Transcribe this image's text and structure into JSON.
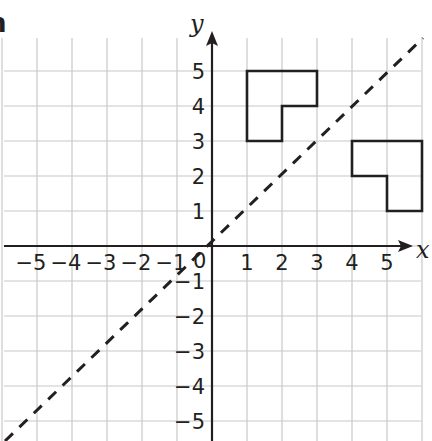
{
  "chart_data": {
    "type": "coordinate-grid",
    "title": "",
    "xlabel": "x",
    "ylabel": "y",
    "xlim": [
      -5,
      5
    ],
    "ylim": [
      -5,
      5
    ],
    "grid": true,
    "x_ticks": [
      "−5",
      "−4",
      "−3",
      "−2",
      "−1",
      "1",
      "2",
      "3",
      "4",
      "5"
    ],
    "y_ticks": [
      "5",
      "4",
      "3",
      "2",
      "1",
      "−1",
      "−2",
      "−3",
      "−4",
      "−5"
    ],
    "origin_label": "0",
    "mirror_line": {
      "equation": "y = x",
      "style": "dashed"
    },
    "shapes": [
      {
        "name": "L-shape A",
        "vertices": [
          [
            1,
            5
          ],
          [
            3,
            5
          ],
          [
            3,
            4
          ],
          [
            2,
            4
          ],
          [
            2,
            3
          ],
          [
            1,
            3
          ]
        ]
      },
      {
        "name": "L-shape B (reflection of A in y = x)",
        "vertices": [
          [
            4,
            3
          ],
          [
            6,
            3
          ],
          [
            6,
            1
          ],
          [
            5,
            1
          ],
          [
            5,
            2
          ],
          [
            4,
            2
          ]
        ]
      }
    ]
  },
  "labels": {
    "x_axis": "x",
    "y_axis": "y",
    "origin": "0",
    "cropped_fragment": "n"
  },
  "colors": {
    "ink": "#231f20",
    "grid": "#c8c8c8",
    "background": "#ffffff"
  }
}
